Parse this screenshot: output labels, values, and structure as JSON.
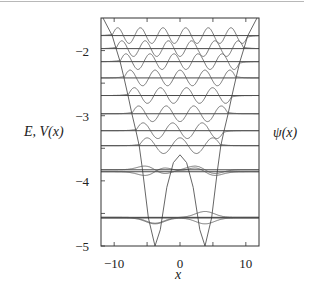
{
  "chart_data": {
    "type": "line",
    "title": "",
    "xlabel": "x",
    "ylabel": "E, V(x)",
    "right_label": "ψ(x)",
    "xlim": [
      -12,
      12
    ],
    "ylim": [
      -5,
      -1.5
    ],
    "x_ticks": [
      -10,
      -5,
      0,
      5,
      10
    ],
    "x_tick_labels": [
      "−10",
      "0",
      "10"
    ],
    "x_tick_label_values": [
      -10,
      0,
      10
    ],
    "y_ticks": [
      -5,
      -4.5,
      -4,
      -3.5,
      -3,
      -2.5,
      -2
    ],
    "y_tick_labels": [
      "−5",
      "−4",
      "−3",
      "−2"
    ],
    "y_tick_label_values": [
      -5,
      -4,
      -3,
      -2
    ],
    "grid": false,
    "legend": "none",
    "potential": {
      "name": "V(x) double-well potential",
      "x": [
        -11.7,
        -10.3,
        -9.7,
        -9.1,
        -8.5,
        -7.9,
        -7.3,
        -6.7,
        -6.2,
        -5.7,
        -4.8,
        -3.8,
        -3.0,
        -2.0,
        -1.0,
        0
      ],
      "y": [
        -1.5,
        -1.77,
        -1.97,
        -2.17,
        -2.42,
        -2.69,
        -2.97,
        -3.23,
        -3.46,
        -3.83,
        -4.57,
        -5.0,
        -4.75,
        -4.1,
        -3.72,
        -3.6
      ],
      "symmetric": true
    },
    "energy_levels": [
      -4.57,
      -4.56,
      -3.86,
      -3.83,
      -3.46,
      -3.23,
      -2.97,
      -2.69,
      -2.42,
      -2.17,
      -1.97,
      -1.77
    ],
    "series": [
      {
        "name": "psi_0",
        "level": -4.57,
        "nodes": 0,
        "amplitude": 0.1,
        "parity": "even"
      },
      {
        "name": "psi_1",
        "level": -4.56,
        "nodes": 1,
        "amplitude": 0.1,
        "parity": "odd"
      },
      {
        "name": "psi_2",
        "level": -3.86,
        "nodes": 2,
        "amplitude": 0.09,
        "parity": "even"
      },
      {
        "name": "psi_3",
        "level": -3.83,
        "nodes": 3,
        "amplitude": 0.09,
        "parity": "odd"
      },
      {
        "name": "psi_4",
        "level": -3.46,
        "nodes": 4,
        "amplitude": 0.12,
        "parity": "even"
      },
      {
        "name": "psi_5",
        "level": -3.23,
        "nodes": 5,
        "amplitude": 0.12,
        "parity": "odd"
      },
      {
        "name": "psi_6",
        "level": -2.97,
        "nodes": 6,
        "amplitude": 0.12,
        "parity": "even"
      },
      {
        "name": "psi_7",
        "level": -2.69,
        "nodes": 7,
        "amplitude": 0.12,
        "parity": "odd"
      },
      {
        "name": "psi_8",
        "level": -2.42,
        "nodes": 8,
        "amplitude": 0.12,
        "parity": "even"
      },
      {
        "name": "psi_9",
        "level": -2.17,
        "nodes": 9,
        "amplitude": 0.12,
        "parity": "odd"
      },
      {
        "name": "psi_10",
        "level": -1.97,
        "nodes": 10,
        "amplitude": 0.12,
        "parity": "even"
      },
      {
        "name": "psi_11",
        "level": -1.77,
        "nodes": 11,
        "amplitude": 0.12,
        "parity": "odd"
      }
    ]
  },
  "layout": {
    "plot_px": {
      "left": 101,
      "right": 259,
      "top": 18,
      "bottom": 246
    },
    "line_color": "#555555",
    "frame_color": "#333333"
  }
}
